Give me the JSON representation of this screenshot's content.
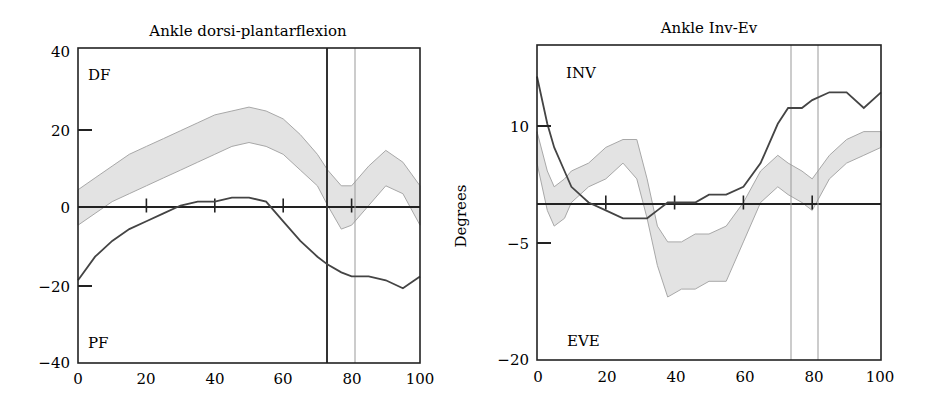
{
  "chart_data": [
    {
      "type": "line",
      "title": "Ankle dorsi-plantarflexion",
      "xlabel": "",
      "ylabel": "",
      "xlim": [
        0,
        100
      ],
      "ylim": [
        -40,
        40
      ],
      "x_ticks": [
        "0",
        "20",
        "40",
        "60",
        "80",
        "100"
      ],
      "y_ticks": [
        "40",
        "20",
        "0",
        "-20",
        "-40"
      ],
      "annotations": {
        "top": "DF",
        "bottom": "PF"
      },
      "vertical_lines": [
        {
          "x": 73,
          "style": "dark"
        },
        {
          "x": 81,
          "style": "light"
        }
      ],
      "zero_line_ticks": [
        20,
        40,
        60,
        80
      ],
      "x": [
        0,
        5,
        10,
        15,
        20,
        25,
        30,
        35,
        40,
        45,
        50,
        55,
        60,
        65,
        70,
        73,
        77,
        80,
        85,
        90,
        95,
        100
      ],
      "series": [
        {
          "name": "Normal band upper",
          "values": [
            4,
            7,
            10,
            13,
            15,
            17,
            19,
            21,
            23,
            24,
            25,
            24,
            22,
            18,
            13,
            9,
            5,
            5,
            10,
            14,
            11,
            5
          ]
        },
        {
          "name": "Normal band lower",
          "values": [
            -5,
            -2,
            1,
            3,
            5,
            7,
            9,
            11,
            13,
            15,
            16,
            15,
            13,
            9,
            5,
            0,
            -6,
            -5,
            0,
            5,
            3,
            -5
          ]
        },
        {
          "name": "Subject",
          "values": [
            -19,
            -13,
            -9,
            -6,
            -4,
            -2,
            0,
            1,
            1,
            2,
            2,
            1,
            -4,
            -9,
            -13,
            -15,
            -17,
            -18,
            -18,
            -19,
            -21,
            -18
          ]
        }
      ]
    },
    {
      "type": "line",
      "title": "Ankle Inv-Ev",
      "xlabel": "",
      "ylabel": "Degrees",
      "xlim": [
        0,
        100
      ],
      "ylim": [
        -20,
        20
      ],
      "x_ticks": [
        "0",
        "20",
        "40",
        "60",
        "80",
        "100"
      ],
      "y_ticks": [
        "10",
        "-5",
        "-20"
      ],
      "annotations": {
        "top": "INV",
        "bottom": "EVE"
      },
      "vertical_lines": [
        {
          "x": 73,
          "style": "light"
        },
        {
          "x": 81,
          "style": "light"
        }
      ],
      "zero_line_ticks": [
        20,
        40,
        60,
        80
      ],
      "x": [
        0,
        3,
        5,
        8,
        10,
        15,
        20,
        25,
        29,
        32,
        35,
        38,
        42,
        46,
        50,
        55,
        60,
        65,
        70,
        73,
        77,
        80,
        85,
        90,
        95,
        100
      ],
      "series": [
        {
          "name": "Normal band upper",
          "values": [
            9,
            4,
            2,
            3,
            4,
            5,
            7,
            8,
            8,
            3,
            -3,
            -5,
            -5,
            -4,
            -4,
            -3,
            0,
            4,
            6,
            5,
            4,
            3,
            6,
            8,
            9,
            9
          ]
        },
        {
          "name": "Normal band lower",
          "values": [
            5,
            -1,
            -3,
            -2,
            0,
            2,
            3,
            5,
            3,
            -2,
            -8,
            -12,
            -11,
            -11,
            -10,
            -10,
            -5,
            0,
            2,
            1,
            0,
            -1,
            3,
            5,
            6,
            7
          ]
        },
        {
          "name": "Subject",
          "values": [
            16,
            10,
            7,
            4,
            2,
            0,
            -1,
            -2,
            -2,
            -2,
            -1,
            0,
            0,
            0,
            1,
            1,
            2,
            5,
            10,
            12,
            12,
            13,
            14,
            14,
            12,
            14
          ]
        }
      ]
    }
  ]
}
